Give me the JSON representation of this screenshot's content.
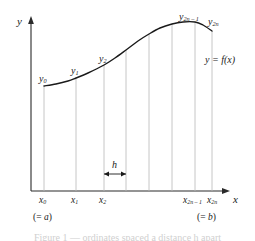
{
  "figure": {
    "background": "#ffffff",
    "ink": "#1a1a1a",
    "grid_color": "#b8b8b8",
    "width": 255,
    "height": 241
  },
  "axes": {
    "y_label": "y",
    "x_label": "x",
    "x_axis_y": 191,
    "y_axis_x": 31,
    "x_axis_start": 31,
    "x_axis_end": 228,
    "y_axis_top": 18
  },
  "curve": {
    "label_text": "y",
    "label_eq": "= f(",
    "label_var": "x",
    "label_close": ")",
    "label_full": "y = f(x)",
    "color": "#1a1a1a",
    "width": 1.4,
    "points": [
      [
        44,
        86
      ],
      [
        56,
        84
      ],
      [
        68,
        81
      ],
      [
        76,
        78
      ],
      [
        88,
        73
      ],
      [
        104,
        65
      ],
      [
        115,
        58
      ],
      [
        126,
        50
      ],
      [
        138,
        41
      ],
      [
        149,
        34
      ],
      [
        160,
        28
      ],
      [
        172,
        24
      ],
      [
        183,
        22
      ],
      [
        195,
        22
      ],
      [
        203,
        25
      ],
      [
        212,
        31
      ]
    ]
  },
  "ordinates": [
    {
      "id": "y0",
      "x": 44,
      "y_top": 86,
      "y_label": "y",
      "sub": "0",
      "x_label": "x",
      "x_sub": "0",
      "note": "(= a)"
    },
    {
      "id": "y1",
      "x": 76,
      "y_top": 78,
      "y_label": "y",
      "sub": "1",
      "x_label": "x",
      "x_sub": "1",
      "note": ""
    },
    {
      "id": "y2",
      "x": 104,
      "y_top": 65,
      "y_label": "y",
      "sub": "2",
      "x_label": "x",
      "x_sub": "2",
      "note": ""
    },
    {
      "id": "y3",
      "x": 126,
      "y_top": 50,
      "y_label": "",
      "sub": "",
      "x_label": "",
      "x_sub": "",
      "note": ""
    },
    {
      "id": "y4",
      "x": 149,
      "y_top": 34,
      "y_label": "",
      "sub": "",
      "x_label": "",
      "x_sub": "",
      "note": ""
    },
    {
      "id": "y5",
      "x": 172,
      "y_top": 24,
      "y_label": "",
      "sub": "",
      "x_label": "",
      "x_sub": "",
      "note": ""
    },
    {
      "id": "y2n-1",
      "x": 195,
      "y_top": 22,
      "y_label": "y",
      "sub": "2n – 1",
      "x_label": "x",
      "x_sub": "2n – 1",
      "note": ""
    },
    {
      "id": "y2n",
      "x": 212,
      "y_top": 31,
      "y_label": "y",
      "sub": "2n",
      "x_label": "x",
      "x_sub": "2n",
      "note": "(= b)"
    }
  ],
  "ordinate_labels": [
    {
      "text": "y",
      "sub": "0",
      "x": 39,
      "y": 74
    },
    {
      "text": "y",
      "sub": "1",
      "x": 71,
      "y": 66
    },
    {
      "text": "y",
      "sub": "2",
      "x": 99,
      "y": 54
    },
    {
      "text": "y",
      "sub": "2n – 1",
      "x": 179,
      "y": 12
    },
    {
      "text": "y",
      "sub": "2n",
      "x": 208,
      "y": 17
    }
  ],
  "abscissa_labels": [
    {
      "text": "x",
      "sub": "0",
      "x": 39,
      "y": 196
    },
    {
      "text": "x",
      "sub": "1",
      "x": 71,
      "y": 196
    },
    {
      "text": "x",
      "sub": "2",
      "x": 99,
      "y": 196
    },
    {
      "text": "x",
      "sub": "2n – 1",
      "x": 183,
      "y": 196
    },
    {
      "text": "x",
      "sub": "2n",
      "x": 207,
      "y": 196
    }
  ],
  "notes": [
    {
      "prefix": "(= ",
      "var": "a",
      "suffix": ")",
      "text": "(= a)",
      "x": 33,
      "y": 213
    },
    {
      "prefix": "(= ",
      "var": "b",
      "suffix": ")",
      "text": "(= b)",
      "x": 197,
      "y": 213
    }
  ],
  "step_marker": {
    "label": "h",
    "x_start": 104,
    "x_end": 126,
    "arrow_y": 174,
    "label_x": 112,
    "label_y": 160
  },
  "curve_annotation": {
    "text": "y = f(x)",
    "x": 205,
    "y": 55
  },
  "caption": {
    "text": "Figure 1 — ordinates spaced a distance h apart"
  }
}
